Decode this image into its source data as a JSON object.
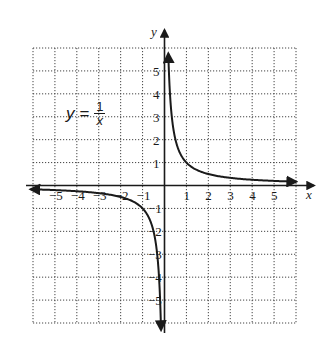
{
  "chart_data": {
    "type": "line",
    "equation": {
      "lhs": "y =",
      "numerator": "1",
      "denominator": "x"
    },
    "xlabel": "x",
    "ylabel": "y",
    "xlim": [
      -6,
      6
    ],
    "ylim": [
      -6,
      6
    ],
    "grid": true,
    "grid_style": "dotted",
    "x_ticks": [
      -5,
      -4,
      -3,
      -2,
      -1,
      1,
      2,
      3,
      4,
      5
    ],
    "y_ticks": [
      -5,
      -4,
      -3,
      -2,
      -1,
      1,
      2,
      3,
      4,
      5
    ],
    "x_tick_labels": [
      "−5",
      "−4",
      "−3",
      "−2",
      "−1",
      "1",
      "2",
      "3",
      "4",
      "5"
    ],
    "y_tick_labels": [
      "−5",
      "−4",
      "−3",
      "−2",
      "−1",
      "1",
      "2",
      "3",
      "4",
      "5"
    ],
    "series": [
      {
        "name": "y = 1/x (x > 0)",
        "x": [
          0.18,
          0.2,
          0.25,
          0.333,
          0.5,
          1,
          2,
          3,
          4,
          5,
          6
        ],
        "y": [
          5.5,
          5,
          4,
          3,
          2,
          1,
          0.5,
          0.333,
          0.25,
          0.2,
          0.167
        ]
      },
      {
        "name": "y = 1/x (x < 0)",
        "x": [
          -6,
          -5,
          -4,
          -3,
          -2,
          -1,
          -0.5,
          -0.333,
          -0.25,
          -0.2,
          -0.18
        ],
        "y": [
          -0.167,
          -0.2,
          -0.25,
          -0.333,
          -0.5,
          -1,
          -2,
          -3,
          -4,
          -5,
          -5.5
        ]
      }
    ],
    "annotations": [
      "y = 1/x"
    ],
    "arrows": "curve ends have arrowheads indicating continuation"
  }
}
